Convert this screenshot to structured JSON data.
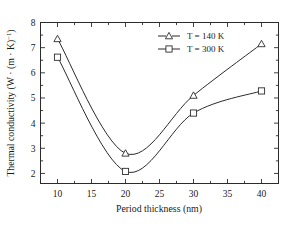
{
  "chart_data": {
    "type": "line",
    "title": "",
    "xlabel": "Period thickness (nm)",
    "ylabel": "Thermal conductivity (W · (m · K)",
    "ylabel_superscript": "−1",
    "ylabel_suffix": ")",
    "xlim": [
      7.5,
      42.5
    ],
    "ylim": [
      1.6,
      8.0
    ],
    "xticks": [
      10,
      15,
      20,
      25,
      30,
      35,
      40
    ],
    "xticklabels": [
      "10",
      "15",
      "20",
      "25",
      "30",
      "35",
      "40"
    ],
    "yticks": [
      2,
      3,
      4,
      5,
      6,
      7,
      8
    ],
    "yticklabels": [
      "2",
      "3",
      "4",
      "5",
      "6",
      "7",
      "8"
    ],
    "grid": false,
    "legend_position": "top-right",
    "x": [
      10,
      20,
      30,
      40
    ],
    "series": [
      {
        "name": "T = 140 K",
        "marker": "triangle",
        "values": [
          7.35,
          2.8,
          5.1,
          7.15
        ]
      },
      {
        "name": "T = 300 K",
        "marker": "square",
        "values": [
          6.62,
          2.08,
          4.4,
          5.28
        ]
      }
    ]
  },
  "legend": {
    "items": [
      {
        "label": "T = 140 K",
        "marker": "triangle-marker"
      },
      {
        "label": "T = 300 K",
        "marker": "square-marker"
      }
    ]
  }
}
